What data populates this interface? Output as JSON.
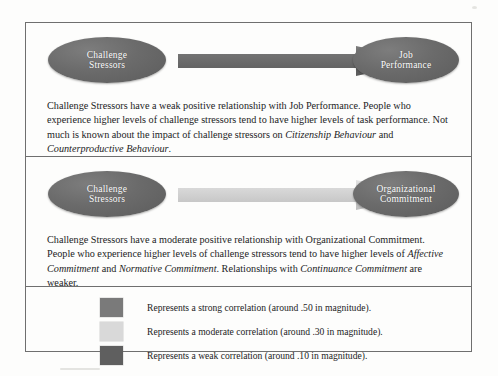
{
  "figure": {
    "panels": [
      {
        "id": "challenge-job-performance",
        "source_node": "Challenge\nStressors",
        "source_line1": "Challenge",
        "source_line2": "Stressors",
        "target_line1": "Job",
        "target_line2": "Performance",
        "arrow_strength": "weak",
        "arrow_color": "#6d6d6d",
        "text_parts": [
          {
            "text": "Challenge Stressors have a weak positive relationship with Job Performance. People who experience higher levels of challenge stressors tend to have higher levels of task performance. Not much is known about the impact of challenge stressors on ",
            "italic": false
          },
          {
            "text": "Citizenship Behaviour",
            "italic": true
          },
          {
            "text": " and ",
            "italic": false
          },
          {
            "text": "Counterproductive Behaviour",
            "italic": true
          },
          {
            "text": ".",
            "italic": false
          }
        ]
      },
      {
        "id": "challenge-organizational-commitment",
        "source_line1": "Challenge",
        "source_line2": "Stressors",
        "target_line1": "Organizational",
        "target_line2": "Commitment",
        "arrow_strength": "moderate",
        "arrow_color": "#d2d2d2",
        "text_parts": [
          {
            "text": "Challenge Stressors have a moderate positive relationship with Organizational Commitment. People who experience higher levels of challenge stressors tend to have higher levels of ",
            "italic": false
          },
          {
            "text": "Affective Commitment",
            "italic": true
          },
          {
            "text": " and ",
            "italic": false
          },
          {
            "text": "Normative Commitment",
            "italic": true
          },
          {
            "text": ". Relationships with ",
            "italic": false
          },
          {
            "text": "Continuance Commitment",
            "italic": true
          },
          {
            "text": " are weaker.",
            "italic": false
          }
        ]
      }
    ],
    "legend": {
      "items": [
        {
          "color": "#7a7a7a",
          "label": "Represents a strong correlation (around .50 in magnitude)."
        },
        {
          "color": "#d9d9d9",
          "label": "Represents a moderate correlation (around .30 in magnitude)."
        },
        {
          "color": "#5f5f5f",
          "label": "Represents a weak correlation (around .10 in magnitude)."
        }
      ]
    }
  }
}
